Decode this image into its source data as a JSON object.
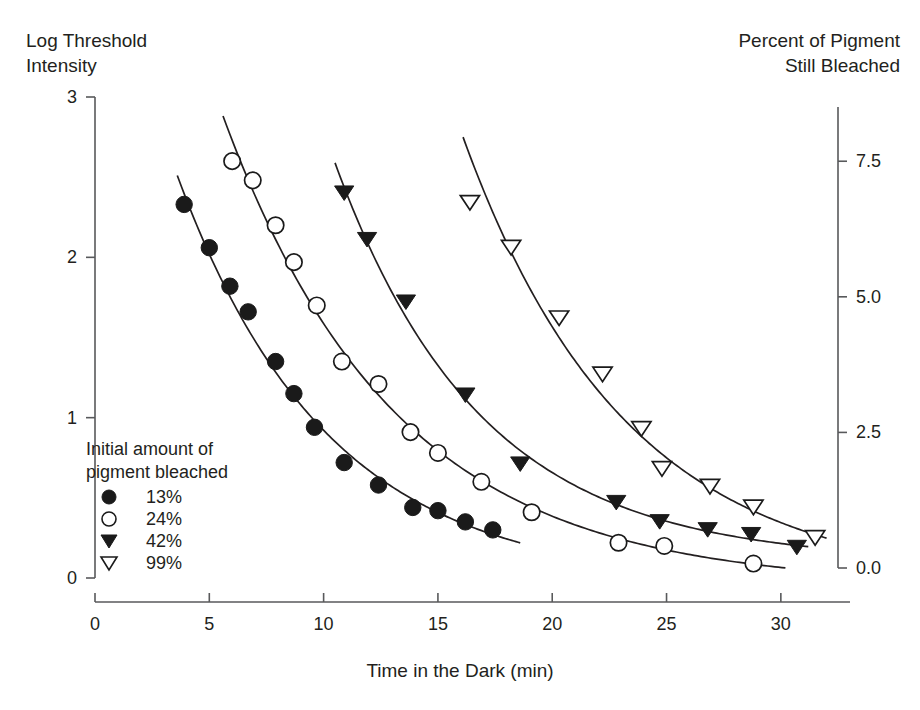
{
  "figure": {
    "left_axis_title": "Log Threshold\nIntensity",
    "right_axis_title": "Percent of Pigment\nStill Bleached",
    "x_axis_title": "Time in the Dark (min)"
  },
  "legend": {
    "title": "Initial amount of\npigment bleached",
    "entries": [
      {
        "marker": "filled-circle-icon",
        "label": "13%"
      },
      {
        "marker": "open-circle-icon",
        "label": "24%"
      },
      {
        "marker": "filled-triangle-down-icon",
        "label": "42%"
      },
      {
        "marker": "open-triangle-down-icon",
        "label": "99%"
      }
    ]
  },
  "axes": {
    "x_ticks": [
      "0",
      "5",
      "10",
      "15",
      "20",
      "25",
      "30"
    ],
    "y_left_ticks": [
      "0",
      "1",
      "2",
      "3"
    ],
    "y_right_ticks": [
      "0.0",
      "2.5",
      "5.0",
      "7.5"
    ]
  },
  "chart_data": {
    "type": "scatter",
    "title": "",
    "xlabel": "Time in the Dark (min)",
    "ylabel": "Log Threshold Intensity",
    "y2label": "Percent of Pigment Still Bleached",
    "xlim": [
      0,
      32.5
    ],
    "ylim": [
      0,
      3
    ],
    "y2lim": [
      0.0,
      8.5
    ],
    "grid": false,
    "legend_position": "inside-lower-left",
    "legend_title": "Initial amount of pigment bleached",
    "series": [
      {
        "name": "13%",
        "marker": "filled-circle",
        "points": [
          [
            3.9,
            2.33
          ],
          [
            5.0,
            2.06
          ],
          [
            5.9,
            1.82
          ],
          [
            6.7,
            1.66
          ],
          [
            7.9,
            1.35
          ],
          [
            8.7,
            1.15
          ],
          [
            9.6,
            0.94
          ],
          [
            10.9,
            0.72
          ],
          [
            12.4,
            0.58
          ],
          [
            13.9,
            0.44
          ],
          [
            15.0,
            0.42
          ],
          [
            16.2,
            0.35
          ],
          [
            17.4,
            0.3
          ]
        ],
        "fit_x_range": [
          3.6,
          18.6
        ]
      },
      {
        "name": "24%",
        "marker": "open-circle",
        "points": [
          [
            6.0,
            2.6
          ],
          [
            6.9,
            2.48
          ],
          [
            7.9,
            2.2
          ],
          [
            8.7,
            1.97
          ],
          [
            9.7,
            1.7
          ],
          [
            10.8,
            1.35
          ],
          [
            12.4,
            1.21
          ],
          [
            13.8,
            0.91
          ],
          [
            15.0,
            0.78
          ],
          [
            16.9,
            0.6
          ],
          [
            19.1,
            0.41
          ],
          [
            22.9,
            0.22
          ],
          [
            24.9,
            0.2
          ],
          [
            28.8,
            0.09
          ]
        ],
        "fit_x_range": [
          5.6,
          30.2
        ]
      },
      {
        "name": "42%",
        "marker": "filled-triangle-down",
        "points": [
          [
            10.9,
            2.4
          ],
          [
            11.9,
            2.11
          ],
          [
            13.6,
            1.72
          ],
          [
            16.2,
            1.14
          ],
          [
            18.6,
            0.71
          ],
          [
            22.8,
            0.47
          ],
          [
            24.7,
            0.35
          ],
          [
            26.8,
            0.3
          ],
          [
            28.7,
            0.27
          ],
          [
            30.7,
            0.19
          ]
        ],
        "fit_x_range": [
          10.5,
          31.2
        ]
      },
      {
        "name": "99%",
        "marker": "open-triangle-down",
        "points": [
          [
            16.4,
            2.34
          ],
          [
            18.2,
            2.06
          ],
          [
            20.3,
            1.62
          ],
          [
            22.2,
            1.27
          ],
          [
            23.9,
            0.93
          ],
          [
            24.8,
            0.68
          ],
          [
            26.9,
            0.57
          ],
          [
            28.8,
            0.44
          ],
          [
            31.5,
            0.25
          ]
        ],
        "fit_x_range": [
          16.1,
          32.0
        ]
      }
    ]
  }
}
